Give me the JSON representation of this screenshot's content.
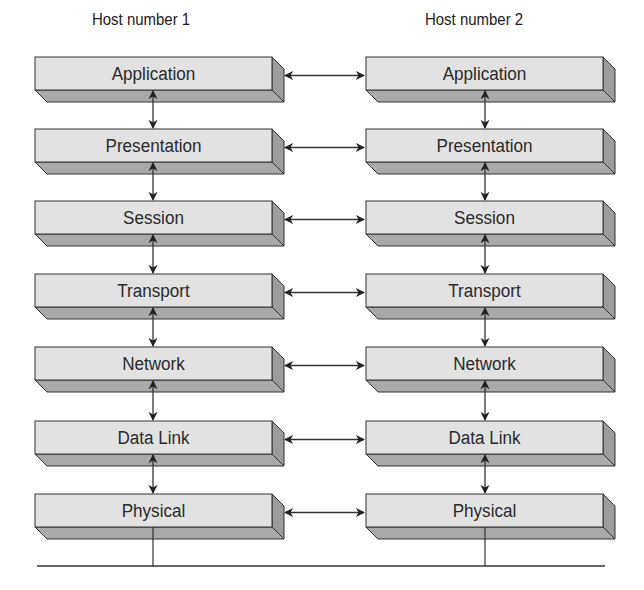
{
  "diagram": {
    "hosts": [
      {
        "label": "Host number 1"
      },
      {
        "label": "Host number 2"
      }
    ],
    "layers": [
      {
        "label": "Application"
      },
      {
        "label": "Presentation"
      },
      {
        "label": "Session"
      },
      {
        "label": "Transport"
      },
      {
        "label": "Network"
      },
      {
        "label": "Data Link"
      },
      {
        "label": "Physical"
      }
    ],
    "connections": {
      "peer_arrows": "bidirectional horizontal arrow between matching layers of host 1 and host 2",
      "stack_arrows": "bidirectional vertical arrows between adjacent layers in each host",
      "medium": "horizontal line below Physical layer linking both hosts"
    },
    "colors": {
      "box_front": "#e2e2e2",
      "box_bottom": "#a9a9a9",
      "box_side": "#9c9c9c",
      "stroke": "#333333",
      "text": "#2a2a2a"
    }
  }
}
